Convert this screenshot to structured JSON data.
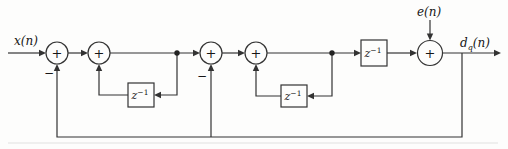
{
  "figure": {
    "type": "signal-flow-block-diagram",
    "line_color": "#333333",
    "background": "#fdfdfc"
  },
  "labels": {
    "input_signal": "x(n)",
    "error_signal": "e(n)",
    "output": {
      "base": "d",
      "subscript": "q",
      "argument": "(n)"
    }
  },
  "symbols": {
    "minus": "−"
  },
  "components": {
    "summing_junctions": [
      {
        "id": "sum-1",
        "sign": "+",
        "negative_feedback_input": true
      },
      {
        "id": "sum-2",
        "sign": "+",
        "negative_feedback_input": false
      },
      {
        "id": "sum-3",
        "sign": "+",
        "negative_feedback_input": true
      },
      {
        "id": "sum-4",
        "sign": "+",
        "negative_feedback_input": false
      },
      {
        "id": "sum-5",
        "sign": "+",
        "negative_feedback_input": false
      }
    ],
    "delays": [
      {
        "base": "z",
        "exponent": "−1"
      },
      {
        "base": "z",
        "exponent": "−1"
      },
      {
        "base": "z",
        "exponent": "−1"
      }
    ]
  }
}
